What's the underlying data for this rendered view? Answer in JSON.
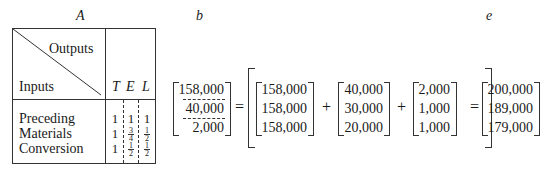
{
  "labels": {
    "A": "A",
    "b": "b",
    "e": "e"
  },
  "table_A": {
    "header_outputs": "Outputs",
    "header_inputs": "Inputs",
    "columns": [
      "T",
      "E",
      "L"
    ],
    "rows": [
      {
        "label": "Preceding",
        "values": [
          "1",
          "1",
          "1"
        ]
      },
      {
        "label": "Materials",
        "values": [
          "1",
          "3/4",
          "1/2"
        ]
      },
      {
        "label": "Conversion",
        "values": [
          "1",
          "1/2",
          "1/2"
        ]
      }
    ]
  },
  "equation": {
    "b": [
      "158,000",
      "40,000",
      "2,000"
    ],
    "equals": "=",
    "plus": "+",
    "term1": [
      "158,000",
      "158,000",
      "158,000"
    ],
    "term2": [
      "40,000",
      "30,000",
      "20,000"
    ],
    "term3": [
      "2,000",
      "1,000",
      "1,000"
    ],
    "e": [
      "200,000",
      "189,000",
      "179,000"
    ]
  }
}
